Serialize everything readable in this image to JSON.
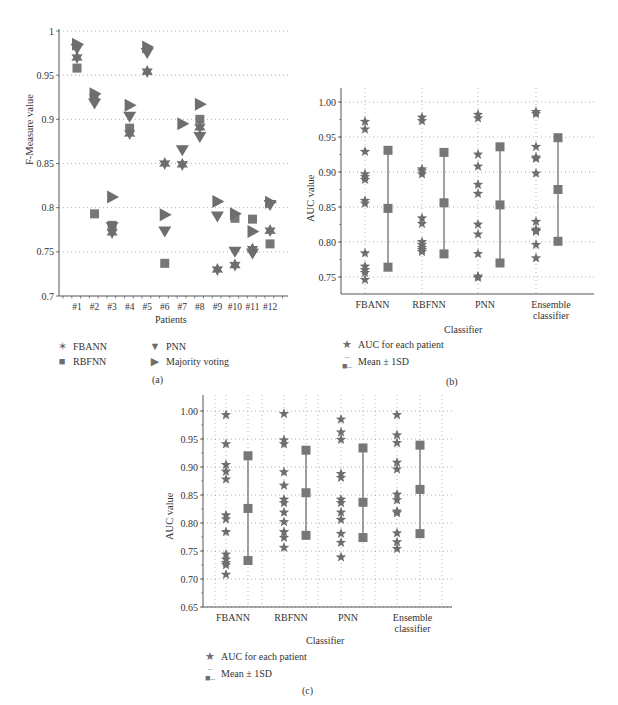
{
  "figure": {
    "captions": {
      "a": "(a)",
      "b": "(b)",
      "c": "(c)"
    }
  },
  "colors": {
    "marker": "#6e6e6e",
    "axis": "#555555",
    "grid": "#9a9a9a",
    "text": "#333333"
  },
  "chart_data": [
    {
      "id": "a",
      "type": "scatter",
      "title": "",
      "xlabel": "Patients",
      "ylabel": "F-Measure value",
      "ylim": [
        0.7,
        1.0
      ],
      "yticks": [
        "0.7",
        "0.75",
        "0.8",
        "0.85",
        "0.9",
        "0.95",
        "1"
      ],
      "ytick_values": [
        0.7,
        0.75,
        0.8,
        0.85,
        0.9,
        0.95,
        1.0
      ],
      "grid": "horizontal dotted",
      "categories": [
        "#1",
        "#2",
        "#3",
        "#4",
        "#5",
        "#6",
        "#7",
        "#8",
        "#9",
        "#10",
        "#11",
        "#12"
      ],
      "series": [
        {
          "name": "FBANN",
          "marker": "star6",
          "values": [
            0.97,
            0.925,
            0.772,
            0.884,
            0.954,
            0.85,
            0.849,
            0.891,
            0.73,
            0.735,
            0.753,
            0.774
          ]
        },
        {
          "name": "RBFNN",
          "marker": "square",
          "values": [
            0.958,
            null,
            0.78,
            0.89,
            null,
            0.737,
            null,
            0.9,
            null,
            0.788,
            0.787,
            0.759
          ]
        },
        {
          "name": "PNN",
          "marker": "triangle-down",
          "values": [
            0.98,
            0.918,
            0.778,
            0.903,
            0.975,
            0.773,
            0.865,
            0.88,
            0.79,
            0.75,
            0.748,
            0.803
          ]
        },
        {
          "name": "Majority voting",
          "marker": "triangle-right",
          "values": [
            0.985,
            0.929,
            0.812,
            0.916,
            0.982,
            0.792,
            0.895,
            0.917,
            0.807,
            0.793,
            0.773,
            0.806
          ]
        }
      ],
      "extra_points": [
        {
          "series": "RBFNN",
          "category": "#2",
          "value": 0.793
        }
      ],
      "legend": {
        "position": "bottom",
        "entries": [
          "FBANN",
          "RBFNN",
          "PNN",
          "Majority voting"
        ]
      }
    },
    {
      "id": "b",
      "type": "scatter",
      "title": "",
      "xlabel": "Classifier",
      "ylabel": "AUC value",
      "ylim": [
        0.725,
        1.02
      ],
      "yticks": [
        "0.75",
        "0.80",
        "0.85",
        "0.90",
        "0.95",
        "1.00"
      ],
      "ytick_values": [
        0.75,
        0.8,
        0.85,
        0.9,
        0.95,
        1.0
      ],
      "grid": "dotted both",
      "categories": [
        "FBANN",
        "RBFNN",
        "PNN",
        "Ensemble classifier"
      ],
      "series": [
        {
          "name": "AUC for each patient",
          "marker": "star5",
          "values": [
            [
              0.972,
              0.961,
              0.929,
              0.897,
              0.893,
              0.889,
              0.859,
              0.855,
              0.784,
              0.765,
              0.76,
              0.756,
              0.746
            ],
            [
              0.978,
              0.973,
              0.904,
              0.901,
              0.897,
              0.834,
              0.826,
              0.8,
              0.796,
              0.792,
              0.789,
              0.786
            ],
            [
              0.982,
              0.977,
              0.925,
              0.908,
              0.882,
              0.869,
              0.825,
              0.811,
              0.783,
              0.751,
              0.749
            ],
            [
              0.986,
              0.983,
              0.936,
              0.921,
              0.919,
              0.898,
              0.829,
              0.818,
              0.816,
              0.815,
              0.796,
              0.777
            ]
          ]
        },
        {
          "name": "Mean ± 1SD",
          "marker": "square-errorbar",
          "mean": [
            0.848,
            0.856,
            0.853,
            0.875
          ],
          "upper": [
            0.931,
            0.928,
            0.936,
            0.949
          ],
          "lower": [
            0.764,
            0.783,
            0.77,
            0.801
          ]
        }
      ],
      "legend": {
        "position": "bottom-left",
        "entries": [
          "AUC for each patient",
          "Mean ± 1SD"
        ]
      }
    },
    {
      "id": "c",
      "type": "scatter",
      "title": "",
      "xlabel": "Classifier",
      "ylabel": "AUC value",
      "ylim": [
        0.65,
        1.025
      ],
      "yticks": [
        "0.65",
        "0.70",
        "0.75",
        "0.80",
        "0.85",
        "0.90",
        "0.95",
        "1.00"
      ],
      "ytick_values": [
        0.65,
        0.7,
        0.75,
        0.8,
        0.85,
        0.9,
        0.95,
        1.0
      ],
      "grid": "dotted both",
      "categories": [
        "FBANN",
        "RBFNN",
        "PNN",
        "Ensemble classifier"
      ],
      "series": [
        {
          "name": "AUC for each patient",
          "marker": "star5",
          "values": [
            [
              0.993,
              0.941,
              0.904,
              0.892,
              0.878,
              0.814,
              0.807,
              0.784,
              0.744,
              0.735,
              0.729,
              0.725,
              0.708
            ],
            [
              0.995,
              0.948,
              0.941,
              0.891,
              0.867,
              0.842,
              0.836,
              0.819,
              0.802,
              0.784,
              0.774,
              0.756
            ],
            [
              0.985,
              0.962,
              0.949,
              0.888,
              0.881,
              0.842,
              0.836,
              0.819,
              0.806,
              0.781,
              0.765,
              0.739
            ],
            [
              0.993,
              0.957,
              0.943,
              0.908,
              0.896,
              0.851,
              0.841,
              0.821,
              0.818,
              0.782,
              0.766,
              0.754
            ]
          ]
        },
        {
          "name": "Mean ± 1SD",
          "marker": "square-errorbar",
          "mean": [
            0.826,
            0.854,
            0.837,
            0.86
          ],
          "upper": [
            0.92,
            0.93,
            0.934,
            0.939
          ],
          "lower": [
            0.733,
            0.778,
            0.774,
            0.781
          ]
        }
      ],
      "legend": {
        "position": "bottom-left",
        "entries": [
          "AUC for each patient",
          "Mean ± 1SD"
        ]
      }
    }
  ]
}
